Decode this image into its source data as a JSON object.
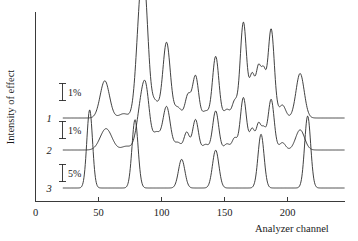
{
  "chart_data": {
    "type": "line",
    "title": "",
    "xlabel": "Analyzer channel",
    "ylabel": "Intensity of effect",
    "xlim": [
      0,
      245
    ],
    "xticks": [
      0,
      50,
      100,
      150,
      200
    ],
    "xtick_labels": [
      "0",
      "50",
      "100",
      "150",
      "200"
    ],
    "grid": false,
    "legend": "inline-curve-numbers",
    "y_axis_ticks_shown": false,
    "note": "Three vertically offset spectra, each with its own percentage scale bar.",
    "series": [
      {
        "name": "1",
        "label": "1",
        "scale_bar": "1%",
        "baseline_level": 0,
        "x_start": 22,
        "x_end": 245,
        "peaks": [
          {
            "center": 55,
            "height": 3.05,
            "width": 5.2
          },
          {
            "center": 70,
            "height": 0.35,
            "width": 5.0
          },
          {
            "center": 83,
            "height": 7.55,
            "width": 4.6
          },
          {
            "center": 87,
            "height": 7.35,
            "width": 4.2
          },
          {
            "center": 95,
            "height": 1.25,
            "width": 4.0
          },
          {
            "center": 104,
            "height": 6.2,
            "width": 4.2
          },
          {
            "center": 113,
            "height": 0.85,
            "width": 4.0
          },
          {
            "center": 121,
            "height": 1.85,
            "width": 3.2
          },
          {
            "center": 127,
            "height": 3.45,
            "width": 3.4
          },
          {
            "center": 135,
            "height": 0.55,
            "width": 3.4
          },
          {
            "center": 143,
            "height": 5.05,
            "width": 3.6
          },
          {
            "center": 152,
            "height": 0.7,
            "width": 3.4
          },
          {
            "center": 158,
            "height": 1.3,
            "width": 2.8
          },
          {
            "center": 165,
            "height": 7.85,
            "width": 3.6
          },
          {
            "center": 172,
            "height": 3.4,
            "width": 3.0
          },
          {
            "center": 177,
            "height": 3.9,
            "width": 2.8
          },
          {
            "center": 181,
            "height": 3.3,
            "width": 2.6
          },
          {
            "center": 187,
            "height": 7.3,
            "width": 3.6
          },
          {
            "center": 196,
            "height": 1.05,
            "width": 3.6
          },
          {
            "center": 210,
            "height": 3.65,
            "width": 4.6
          }
        ]
      },
      {
        "name": "2",
        "label": "2",
        "scale_bar": "1%",
        "baseline_level": 0,
        "x_start": 22,
        "x_end": 245,
        "peaks": [
          {
            "center": 56,
            "height": 1.75,
            "width": 6.5
          },
          {
            "center": 72,
            "height": 0.3,
            "width": 5.0
          },
          {
            "center": 84,
            "height": 3.55,
            "width": 5.0
          },
          {
            "center": 88,
            "height": 3.4,
            "width": 4.0
          },
          {
            "center": 96,
            "height": 1.35,
            "width": 4.0
          },
          {
            "center": 104,
            "height": 3.55,
            "width": 4.2
          },
          {
            "center": 113,
            "height": 0.6,
            "width": 3.6
          },
          {
            "center": 120,
            "height": 1.45,
            "width": 3.0
          },
          {
            "center": 127,
            "height": 2.5,
            "width": 3.2
          },
          {
            "center": 135,
            "height": 0.45,
            "width": 3.2
          },
          {
            "center": 143,
            "height": 3.2,
            "width": 3.4
          },
          {
            "center": 152,
            "height": 0.5,
            "width": 3.2
          },
          {
            "center": 158,
            "height": 0.95,
            "width": 2.8
          },
          {
            "center": 165,
            "height": 4.3,
            "width": 3.4
          },
          {
            "center": 172,
            "height": 1.7,
            "width": 2.8
          },
          {
            "center": 177,
            "height": 2.05,
            "width": 2.6
          },
          {
            "center": 181,
            "height": 1.6,
            "width": 2.6
          },
          {
            "center": 187,
            "height": 4.15,
            "width": 3.4
          },
          {
            "center": 196,
            "height": 0.6,
            "width": 3.4
          },
          {
            "center": 210,
            "height": 1.65,
            "width": 5.0
          }
        ]
      },
      {
        "name": "3",
        "label": "3",
        "scale_bar": "5%",
        "baseline_level": 0,
        "x_start": 22,
        "x_end": 245,
        "peaks": [
          {
            "center": 43,
            "height": 6.4,
            "width": 3.2
          },
          {
            "center": 79,
            "height": 5.6,
            "width": 3.4
          },
          {
            "center": 116,
            "height": 2.35,
            "width": 3.6
          },
          {
            "center": 143,
            "height": 3.1,
            "width": 3.6
          },
          {
            "center": 179,
            "height": 4.4,
            "width": 3.4
          },
          {
            "center": 216,
            "height": 5.9,
            "width": 3.4
          }
        ]
      }
    ]
  },
  "axes": {
    "x_title": "Analyzer channel",
    "y_title": "Intensity of effect",
    "tick_labels": [
      "0",
      "50",
      "100",
      "150",
      "200"
    ]
  },
  "annotations": {
    "scale_bars": [
      {
        "id": "scale-bar-1",
        "label": "1%"
      },
      {
        "id": "scale-bar-2",
        "label": "1%"
      },
      {
        "id": "scale-bar-3",
        "label": "5%"
      }
    ],
    "curve_labels": [
      "1",
      "2",
      "3"
    ]
  },
  "colors": {
    "curve": "#2b2b2b",
    "axis": "#3a3a3a",
    "text": "#1a1a1a",
    "background": "#ffffff"
  }
}
